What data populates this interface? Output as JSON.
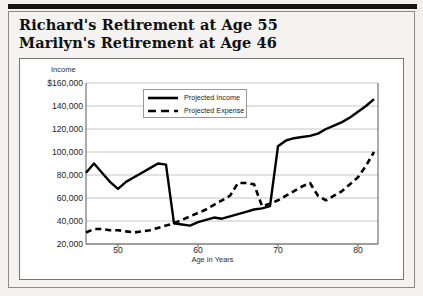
{
  "title": {
    "line1": "Richard's Retirement at Age 55",
    "line2": "Marilyn's Retirement at Age 46"
  },
  "chart_data": {
    "type": "line",
    "title": "",
    "xlabel": "Age in Years",
    "ylabel": "Income",
    "xlim": [
      46,
      82.5
    ],
    "ylim": [
      20000,
      160000
    ],
    "grid": true,
    "legend_position": "top-center",
    "ytick_labels": [
      "$160,000",
      "140,000",
      "120,000",
      "100,000",
      "80,000",
      "60,000",
      "40,000",
      "20,000"
    ],
    "yticks": [
      160000,
      140000,
      120000,
      100000,
      80000,
      60000,
      40000,
      20000
    ],
    "xtick_labels": [
      "50",
      "60",
      "70",
      "80"
    ],
    "xticks": [
      50,
      60,
      70,
      80
    ],
    "x": [
      46,
      47,
      48,
      49,
      50,
      51,
      52,
      53,
      54,
      55,
      56,
      57,
      58,
      59,
      60,
      61,
      62,
      63,
      64,
      65,
      66,
      67,
      68,
      69,
      70,
      71,
      72,
      73,
      74,
      75,
      76,
      77,
      78,
      79,
      80,
      81,
      82
    ],
    "series": [
      {
        "name": "Projected Income",
        "style": "solid",
        "color": "#000000",
        "values": [
          82000,
          90000,
          82000,
          74000,
          68000,
          74000,
          78000,
          82000,
          86000,
          90000,
          89000,
          38000,
          37000,
          36000,
          39000,
          41000,
          43000,
          42000,
          44000,
          46000,
          48000,
          50000,
          51000,
          53000,
          105000,
          110000,
          112000,
          113000,
          114000,
          116000,
          120000,
          123000,
          126000,
          130000,
          135000,
          140000,
          146000
        ]
      },
      {
        "name": "Projected Expense",
        "style": "dashed",
        "color": "#000000",
        "values": [
          30000,
          33000,
          33000,
          32000,
          32000,
          31000,
          30000,
          31000,
          32000,
          34000,
          36000,
          38000,
          41000,
          44000,
          47000,
          50000,
          54000,
          58000,
          62000,
          73000,
          73000,
          72000,
          53000,
          55000,
          58000,
          62000,
          66000,
          70000,
          73000,
          62000,
          58000,
          62000,
          66000,
          72000,
          78000,
          88000,
          100000
        ]
      }
    ]
  }
}
